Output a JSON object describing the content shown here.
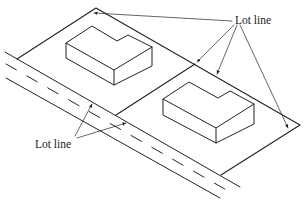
{
  "diagram": {
    "type": "isometric site plan",
    "labels": {
      "lot_line_top": "Lot line",
      "lot_line_bottom": "Lot line"
    },
    "elements": [
      "road with dashed center lines",
      "two lots",
      "two L-shaped buildings",
      "leader arrows"
    ],
    "colors": {
      "line": "#222222",
      "background": "#ffffff"
    }
  }
}
